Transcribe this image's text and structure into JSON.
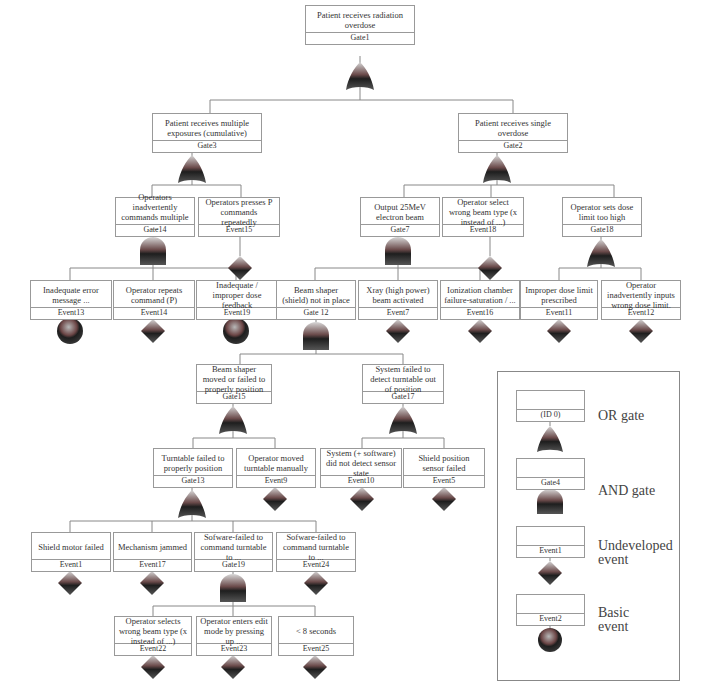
{
  "diagram": {
    "type": "fault-tree",
    "top_event": {
      "desc": "Patient receives radiation overdose",
      "id": "Gate1",
      "symbol": "or-gate"
    },
    "nodes": {
      "gate1": {
        "desc": "Patient receives radiation overdose",
        "id": "Gate1"
      },
      "gate3": {
        "desc": "Patient receives multiple exposures (cumulative)",
        "id": "Gate3"
      },
      "gate2": {
        "desc": "Patient receives single overdose",
        "id": "Gate2"
      },
      "gate14": {
        "desc": "Operators inadvertently commands multiple ...",
        "id": "Gate14"
      },
      "event15": {
        "desc": "Operators presses P commands repeatedly",
        "id": "Event15"
      },
      "gate7": {
        "desc": "Output 25MeV electron beam",
        "id": "Gate7"
      },
      "event18": {
        "desc": "Operator select wrong beam type (x instead of ...)",
        "id": "Event18"
      },
      "gate18": {
        "desc": "Operator sets dose limit too high",
        "id": "Gate18"
      },
      "event13": {
        "desc": "Inadequate error message ...",
        "id": "Event13"
      },
      "event14": {
        "desc": "Operator repeats command (P)",
        "id": "Event14"
      },
      "event19": {
        "desc": "Inadequate / improper dose feedback",
        "id": "Event19"
      },
      "gate12": {
        "desc": "Beam shaper (shield) not in place",
        "id": "Gate 12"
      },
      "event7": {
        "desc": "Xray (high power) beam activated",
        "id": "Event7"
      },
      "event16": {
        "desc": "Ionization chamber failure-saturation / ...",
        "id": "Event16"
      },
      "event11": {
        "desc": "Improper dose limit prescribed",
        "id": "Event11"
      },
      "event12": {
        "desc": "Operator inadvertently inputs wrong dose limit.",
        "id": "Event12"
      },
      "gate15": {
        "desc": "Beam shaper moved or failed to properly position",
        "id": "Gate15"
      },
      "gate17": {
        "desc": "System failed to detect turntable out of position",
        "id": "Gate17"
      },
      "gate13": {
        "desc": "Turntable failed to properly position",
        "id": "Gate13"
      },
      "event9": {
        "desc": "Operator moved turntable manually",
        "id": "Event9"
      },
      "event10": {
        "desc": "System (+ software) did not detect sensor state",
        "id": "Event10"
      },
      "event5": {
        "desc": "Shield position sensor failed",
        "id": "Event5"
      },
      "event1": {
        "desc": "Shield motor failed",
        "id": "Event1"
      },
      "event17": {
        "desc": "Mechanism jammed",
        "id": "Event17"
      },
      "gate19": {
        "desc": "Sofware-failed to command turntable to ...",
        "id": "Gate19"
      },
      "event24": {
        "desc": "Sofware-failed to command turntable to ...",
        "id": "Event24"
      },
      "event22": {
        "desc": "Operator selects wrong beam type (x instead of ...)",
        "id": "Event22"
      },
      "event23": {
        "desc": "Operator enters edit mode by pressing up ...",
        "id": "Event23"
      },
      "event25": {
        "desc": "< 8 seconds",
        "id": "Event25"
      }
    }
  },
  "legend": {
    "items": [
      {
        "id": "(ID 0)",
        "label": "OR gate"
      },
      {
        "id": "Gate4",
        "label": "AND gate"
      },
      {
        "id": "Event1",
        "label_line1": "Undeveloped",
        "label_line2": "event"
      },
      {
        "id": "Event2",
        "label_line1": "Basic",
        "label_line2": "event"
      }
    ]
  },
  "colors": {
    "symbol_light": "#c9c9c9",
    "symbol_dark": "#2a2a2a",
    "symbol_red": "#7a3a3a",
    "line": "#888888",
    "box_border": "#999999"
  }
}
